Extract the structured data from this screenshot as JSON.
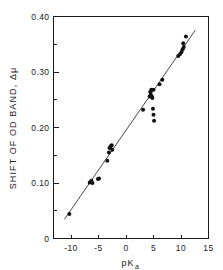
{
  "chart_data": {
    "type": "scatter",
    "title": "",
    "xlabel": "pKa",
    "xlabel_main": "pK",
    "xlabel_sub": "a",
    "ylabel": "SHIFT OF OD BAND, Δμ",
    "ylabel_main": "SHIFT OF OD BAND, ",
    "ylabel_symbol": "Δμ",
    "xlim": [
      -13,
      15
    ],
    "ylim": [
      0,
      0.4
    ],
    "xticks": [
      -10,
      -5,
      0,
      5,
      10,
      15
    ],
    "xtick_labels": [
      "-10",
      "-5",
      "0",
      "5",
      "10",
      "15"
    ],
    "yticks": [
      0,
      0.05,
      0.1,
      0.15,
      0.2,
      0.25,
      0.3,
      0.35,
      0.4
    ],
    "ytick_labels": [
      "0",
      "",
      "0.10",
      "",
      "0.20",
      "",
      "0.30",
      "",
      "0.40"
    ],
    "ytick_major": [
      0,
      0.1,
      0.2,
      0.3,
      0.4
    ],
    "grid": false,
    "legend": null,
    "marker": "filled-circle",
    "marker_size": 2.0,
    "point_color": "#111111",
    "line_color": "#333333",
    "axis_color": "#1a1a1a",
    "background": "#ffffff",
    "fit_line": {
      "x_start": -11.2,
      "y_start": 0.0345,
      "x_end": 12.6,
      "y_end": 0.3755
    },
    "points": [
      {
        "x": -10.3,
        "y": 0.044
      },
      {
        "x": -6.6,
        "y": 0.101
      },
      {
        "x": -6.3,
        "y": 0.104
      },
      {
        "x": -6.1,
        "y": 0.1
      },
      {
        "x": -5.1,
        "y": 0.107
      },
      {
        "x": -4.9,
        "y": 0.108
      },
      {
        "x": -3.4,
        "y": 0.14
      },
      {
        "x": -3.1,
        "y": 0.155
      },
      {
        "x": -3.0,
        "y": 0.163
      },
      {
        "x": -2.8,
        "y": 0.166
      },
      {
        "x": -2.6,
        "y": 0.168
      },
      {
        "x": -2.5,
        "y": 0.16
      },
      {
        "x": 3.1,
        "y": 0.232
      },
      {
        "x": 4.3,
        "y": 0.256
      },
      {
        "x": 4.4,
        "y": 0.264
      },
      {
        "x": 4.5,
        "y": 0.259
      },
      {
        "x": 4.6,
        "y": 0.268
      },
      {
        "x": 4.7,
        "y": 0.256
      },
      {
        "x": 4.8,
        "y": 0.253
      },
      {
        "x": 5.0,
        "y": 0.268
      },
      {
        "x": 4.9,
        "y": 0.234
      },
      {
        "x": 5.0,
        "y": 0.223
      },
      {
        "x": 5.1,
        "y": 0.212
      },
      {
        "x": 6.1,
        "y": 0.278
      },
      {
        "x": 6.6,
        "y": 0.286
      },
      {
        "x": 9.5,
        "y": 0.329
      },
      {
        "x": 9.8,
        "y": 0.332
      },
      {
        "x": 10.1,
        "y": 0.336
      },
      {
        "x": 10.3,
        "y": 0.341
      },
      {
        "x": 10.5,
        "y": 0.345
      },
      {
        "x": 10.4,
        "y": 0.352
      },
      {
        "x": 10.9,
        "y": 0.364
      }
    ]
  }
}
